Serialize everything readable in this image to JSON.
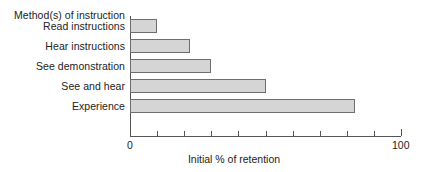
{
  "chart_data": {
    "type": "bar",
    "orientation": "horizontal",
    "title": "",
    "categories": [
      "Read instructions",
      "Hear instructions",
      "See demonstration",
      "See and hear",
      "Experience"
    ],
    "values": [
      10,
      22,
      30,
      50,
      83
    ],
    "xlabel": "Initial % of retention",
    "ylabel": "Method(s) of instruction",
    "xlim": [
      0,
      100
    ],
    "xticks": [
      0,
      10,
      20,
      30,
      40,
      50,
      60,
      70,
      80,
      90,
      100
    ],
    "xtick_labels": [
      "0",
      "",
      "",
      "",
      "",
      "",
      "",
      "",
      "",
      "",
      "100"
    ],
    "grid": false,
    "legend": null,
    "bar_fill_color": "#d5d5d5",
    "bar_border_color": "#6e6e6e",
    "axis_color": "#555555",
    "text_color": "#222222",
    "background_color": "#ffffff"
  },
  "axis": {
    "y_axis_caption": "Method(s) of instruction",
    "x_axis_caption": "Initial % of retention",
    "x_min_label": "0",
    "x_max_label": "100"
  }
}
